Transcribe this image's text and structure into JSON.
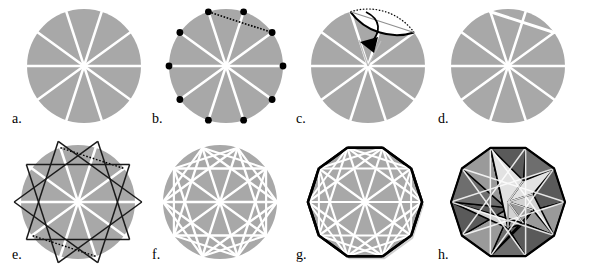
{
  "figure": {
    "panel_count": 8,
    "rows": 2,
    "columns": 4,
    "background_color": "#ffffff"
  },
  "colors": {
    "paper_gray": "#a8a8a8",
    "paper_gray_light": "#b4b4b4",
    "crease_white": "#ffffff",
    "ink_black": "#000000",
    "shade_dark": "#6e6e6e",
    "shade_mid": "#9a9a9a",
    "shade_light": "#d2d2d2",
    "shade_lighter": "#e2e2e2",
    "shade_darkest": "#5a5a5a",
    "halo_gray": "#cfcfcf"
  },
  "geometry": {
    "sectors": 10,
    "diameters": 5,
    "vertices": 10,
    "star_polygon": "{10/3} decagram",
    "angle_step_degrees": 36,
    "circle_radius_px": 57,
    "vertex_dot_radius_px": 3.4
  },
  "panels": [
    {
      "id": "a",
      "label": "a.",
      "name": "circle-with-ten-sectors",
      "description": "Shaded circle creased into ten equal sectors by five white diameters",
      "features": [
        "gray-disc",
        "five-white-diameters"
      ],
      "center": [
        84,
        66
      ],
      "radius": 57,
      "label_pos": [
        12,
        112
      ]
    },
    {
      "id": "b",
      "label": "b.",
      "name": "circle-with-vertex-dots-and-chord",
      "description": "Same creased circle with ten black dots marking the sector vertices and a dotted chord across the upper region",
      "features": [
        "gray-disc",
        "five-white-diameters",
        "ten-black-vertex-dots",
        "dotted-chord"
      ],
      "center": [
        226,
        66
      ],
      "radius": 57,
      "label_pos": [
        152,
        112
      ]
    },
    {
      "id": "c",
      "label": "c.",
      "name": "folding-cap-with-arrow",
      "description": "The circular cap above the chord is folded down, shown as a white lens with a curved black arrow indicating the fold direction",
      "features": [
        "gray-disc",
        "white-folded-cap-lens",
        "dotted-arc",
        "curved-arrow",
        "white-spokes"
      ],
      "center": [
        368,
        66
      ],
      "radius": 57,
      "label_pos": [
        296,
        112
      ]
    },
    {
      "id": "d",
      "label": "d.",
      "name": "circle-with-one-flat-chord",
      "description": "Circle after the first fold, showing a straight white chord flattening the top edge",
      "features": [
        "gray-disc",
        "five-white-diameters",
        "white-chord"
      ],
      "center": [
        508,
        66
      ],
      "radius": 57,
      "label_pos": [
        438,
        112
      ]
    },
    {
      "id": "e",
      "label": "e.",
      "name": "decagram-overlay",
      "description": "Black {10/3} star-polygon crease pattern drawn over the creased circle with dotted horizontal chords",
      "features": [
        "gray-disc",
        "white-diameters",
        "black-decagram",
        "dotted-chords"
      ],
      "center": [
        78,
        202
      ],
      "radius": 57,
      "label_pos": [
        12,
        248
      ]
    },
    {
      "id": "f",
      "label": "f.",
      "name": "complete-white-crease-pattern",
      "description": "All creases shown in white on the gray disc: diameters, chords and star-polygon lines",
      "features": [
        "gray-disc",
        "white-full-crease-network"
      ],
      "center": [
        220,
        202
      ],
      "radius": 57,
      "label_pos": [
        152,
        248
      ]
    },
    {
      "id": "g",
      "label": "g.",
      "name": "folded-decagon-flat",
      "description": "The circle folded to a flat regular decagon outlined in heavy black with white creases inside",
      "features": [
        "gray-decagon",
        "black-outline",
        "white-crease-network",
        "soft-shadow"
      ],
      "center": [
        365,
        202
      ],
      "radius": 57,
      "label_pos": [
        296,
        248
      ]
    },
    {
      "id": "h",
      "label": "h.",
      "name": "assembled-three-dimensional-module",
      "description": "The finished three-dimensional module with five rhombic faces shaded in different grays",
      "features": [
        "shaded-rhombic-faces",
        "black-edges",
        "white-creases",
        "three-dimensional-shading"
      ],
      "center": [
        508,
        202
      ],
      "radius": 57,
      "label_pos": [
        438,
        248
      ]
    }
  ]
}
